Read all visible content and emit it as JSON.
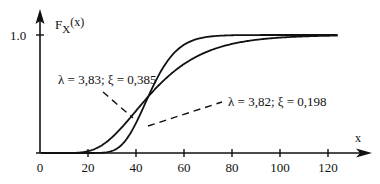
{
  "chart_data": {
    "type": "line",
    "title": "",
    "ylabel": "F_X(x)",
    "ylabel_main": "F",
    "ylabel_sub": "X",
    "ylabel_arg": "(x)",
    "xlabel": "x",
    "xlim": [
      0,
      120
    ],
    "ylim": [
      0,
      1.0
    ],
    "x_ticks": [
      0,
      20,
      40,
      60,
      80,
      100,
      120
    ],
    "x_tick_labels": [
      "0",
      "20",
      "40",
      "60",
      "80",
      "100",
      "120"
    ],
    "y_ticks": [
      1.0
    ],
    "y_tick_labels": [
      "1.0"
    ],
    "grid": false,
    "legend": "annotations",
    "series": [
      {
        "name": "λ = 3,83; ξ = 0,385",
        "distribution": "lognormal",
        "lambda": 3.83,
        "xi": 0.385,
        "x": [
          0,
          10,
          20,
          30,
          40,
          50,
          60,
          70,
          80,
          90,
          100,
          110,
          125
        ],
        "values": [
          0.0,
          0.0,
          0.015,
          0.13,
          0.36,
          0.58,
          0.75,
          0.86,
          0.93,
          0.97,
          0.98,
          0.99,
          1.0
        ]
      },
      {
        "name": "λ = 3,82; ξ = 0,198",
        "distribution": "lognormal",
        "lambda": 3.82,
        "xi": 0.198,
        "x": [
          0,
          10,
          20,
          30,
          40,
          50,
          60,
          70,
          80,
          90,
          100,
          110,
          125
        ],
        "values": [
          0.0,
          0.0,
          0.0,
          0.017,
          0.25,
          0.68,
          0.92,
          0.99,
          1.0,
          1.0,
          1.0,
          1.0,
          1.0
        ]
      }
    ],
    "annotations": [
      {
        "text": "λ = 3,83; ξ = 0,385",
        "points_to": "series 1 at x≈39"
      },
      {
        "text": "λ = 3,82; ξ = 0,198",
        "points_to": "series 2 at x≈44"
      }
    ]
  },
  "labels": {
    "y_tick_1": "1.0",
    "x_axis": "x",
    "annotation_1": "λ = 3,83; ξ = 0,385",
    "annotation_2": "λ = 3,82;  ξ = 0,198"
  }
}
